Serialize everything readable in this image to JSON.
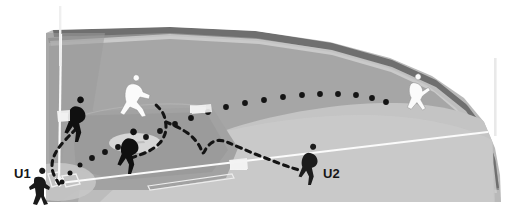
{
  "diagram": {
    "type": "field-play-diagram",
    "sport": "baseball"
  },
  "labels": {
    "umpire_1": "U1",
    "umpire_2": "U2"
  },
  "colors": {
    "background": "#ffffff",
    "outfield_grass": "#a9a9a9",
    "outfield_grass_light": "#c2c2c2",
    "infield_dirt": "#9a9a9a",
    "infield_grass": "#b0b0b0",
    "warning_track": "#b9b9b9",
    "wall_dark": "#6f6f6f",
    "wall_stripe": "#cfcfcf",
    "foul_line": "#ffffff",
    "foul_pole": "#f2f2f2",
    "base_white": "#f4f4f4",
    "mound": "#d5d5d5",
    "player_dark": "#111111",
    "player_light": "#fafafa",
    "ball_path": "#141414",
    "movement_path": "#141414"
  },
  "field_elements": {
    "wall_label": "outfield-wall",
    "left_foul_pole_label": "left-foul-pole",
    "right_foul_pole_label": "right-foul-pole",
    "home_plate_label": "home-plate",
    "pitchers_mound_label": "pitchers-mound",
    "first_base_label": "first-base",
    "second_base_label": "second-base",
    "third_base_label": "third-base",
    "left_foul_line_label": "left-foul-line",
    "right_foul_line_label": "right-foul-line"
  },
  "players": [
    {
      "id": "fielder-third-base",
      "shade": "dark",
      "x": 76,
      "y": 120
    },
    {
      "id": "runner-advancing",
      "shade": "light",
      "x": 133,
      "y": 97
    },
    {
      "id": "fielder-infield",
      "shade": "dark",
      "x": 129,
      "y": 152
    },
    {
      "id": "umpire-u2-figure",
      "shade": "dark",
      "x": 309,
      "y": 165
    },
    {
      "id": "outfielder-right",
      "shade": "light",
      "x": 415,
      "y": 95
    },
    {
      "id": "umpire-u1-figure",
      "shade": "dark",
      "x": 40,
      "y": 188
    }
  ],
  "ball_trajectory": {
    "name": "batted-ball-path",
    "style": "round-dotted",
    "points": [
      [
        62,
        182
      ],
      [
        70,
        173
      ],
      [
        80,
        165
      ],
      [
        92,
        158
      ],
      [
        105,
        152
      ],
      [
        118,
        147
      ],
      [
        131,
        142
      ],
      [
        146,
        137
      ],
      [
        160,
        131
      ],
      [
        175,
        124
      ],
      [
        191,
        118
      ],
      [
        208,
        112
      ],
      [
        226,
        107
      ],
      [
        245,
        103
      ],
      [
        264,
        100
      ],
      [
        283,
        97
      ],
      [
        302,
        95
      ],
      [
        320,
        94
      ],
      [
        338,
        94
      ],
      [
        356,
        95
      ],
      [
        372,
        98
      ],
      [
        386,
        102
      ]
    ]
  },
  "movement_paths": [
    {
      "name": "u1-rotation-path",
      "style": "dashed",
      "points": [
        [
          59,
          184
        ],
        [
          52,
          172
        ],
        [
          52,
          160
        ],
        [
          58,
          148
        ],
        [
          68,
          137
        ],
        [
          77,
          128
        ]
      ]
    },
    {
      "name": "infield-runner-path",
      "style": "dashed",
      "points": [
        [
          131,
          158
        ],
        [
          148,
          152
        ],
        [
          160,
          144
        ],
        [
          166,
          133
        ],
        [
          166,
          122
        ],
        [
          163,
          112
        ],
        [
          156,
          105
        ]
      ]
    },
    {
      "name": "u2-rotation-path",
      "style": "dashed",
      "points": [
        [
          166,
          122
        ],
        [
          180,
          128
        ],
        [
          192,
          136
        ],
        [
          200,
          146
        ],
        [
          203,
          155
        ],
        [
          206,
          148
        ],
        [
          213,
          141
        ],
        [
          222,
          140
        ],
        [
          234,
          145
        ],
        [
          250,
          152
        ],
        [
          268,
          159
        ],
        [
          286,
          166
        ],
        [
          302,
          171
        ]
      ]
    }
  ]
}
